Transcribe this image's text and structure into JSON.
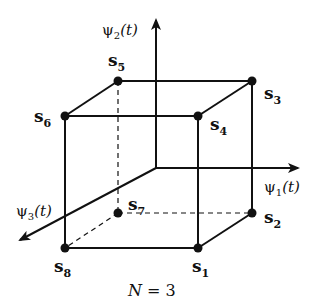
{
  "diagram": {
    "title": "",
    "caption": {
      "var": "N",
      "eq": " = 3"
    },
    "axes": [
      {
        "id": "psi1",
        "label": "ψ",
        "sub": "1",
        "arg": "(t)"
      },
      {
        "id": "psi2",
        "label": "ψ",
        "sub": "2",
        "arg": "(t)"
      },
      {
        "id": "psi3",
        "label": "ψ",
        "sub": "3",
        "arg": "(t)"
      }
    ],
    "points": [
      {
        "id": "s1",
        "base": "s",
        "sub": "1"
      },
      {
        "id": "s2",
        "base": "s",
        "sub": "2"
      },
      {
        "id": "s3",
        "base": "s",
        "sub": "3"
      },
      {
        "id": "s4",
        "base": "s",
        "sub": "4"
      },
      {
        "id": "s5",
        "base": "s",
        "sub": "5"
      },
      {
        "id": "s6",
        "base": "s",
        "sub": "6"
      },
      {
        "id": "s7",
        "base": "s",
        "sub": "7"
      },
      {
        "id": "s8",
        "base": "s",
        "sub": "8"
      }
    ],
    "colors": {
      "ink": "#111111",
      "background": "#ffffff"
    }
  }
}
